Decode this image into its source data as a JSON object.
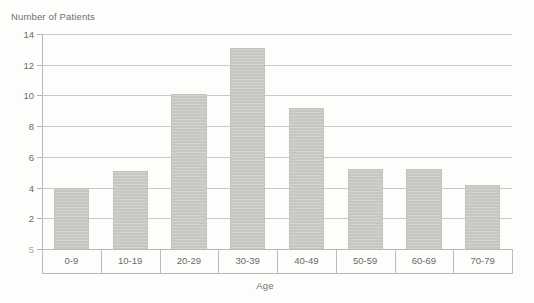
{
  "chart_data": {
    "type": "bar",
    "title": "",
    "xlabel": "Age",
    "ylabel": "Number of Patients",
    "categories": [
      "0-9",
      "10-19",
      "20-29",
      "30-39",
      "40-49",
      "50-59",
      "60-69",
      "70-79"
    ],
    "values": [
      4.0,
      5.1,
      10.1,
      13.1,
      9.2,
      5.2,
      5.2,
      4.2
    ],
    "series": [
      {
        "name": "Number of Patients",
        "values": [
          4.0,
          5.1,
          10.1,
          13.1,
          9.2,
          5.2,
          5.2,
          4.2
        ]
      }
    ],
    "ylim": [
      0,
      14
    ],
    "ytick_labels": [
      "14",
      "12",
      "10",
      "8",
      "6",
      "4",
      "2",
      "5"
    ],
    "ytick_values": [
      14,
      12,
      10,
      8,
      6,
      4,
      2,
      0
    ],
    "grid": true,
    "legend": null,
    "bar_color": "#c8c8c5",
    "grid_color": "#c9c9c7",
    "axis_color": "#b9b9b7",
    "text_color": "#6a6a6a"
  }
}
